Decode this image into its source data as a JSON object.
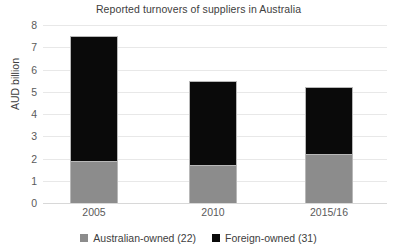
{
  "chart_data": {
    "type": "bar",
    "subtype": "stacked-vertical",
    "title": "Reported turnovers of suppliers in Australia",
    "xlabel": "",
    "ylabel": "AUD billion",
    "categories": [
      "2005",
      "2010",
      "2015/16"
    ],
    "series": [
      {
        "name": "Australian-owned (22)",
        "color": "#8c8c8c",
        "values": [
          1.9,
          1.7,
          2.2
        ]
      },
      {
        "name": "Foreign-owned (31)",
        "color": "#0a0a0a",
        "values": [
          5.6,
          3.8,
          3.0
        ]
      }
    ],
    "totals": [
      7.5,
      5.5,
      5.2
    ],
    "ylim": [
      0,
      8
    ],
    "ytick_labels": [
      "8",
      "7",
      "6",
      "5",
      "4",
      "3",
      "2",
      "1",
      "0"
    ],
    "ytick_values": [
      8,
      7,
      6,
      5,
      4,
      3,
      2,
      1,
      0
    ],
    "grid": true,
    "legend_position": "bottom"
  },
  "legend": {
    "items": [
      {
        "label": "Australian-owned (22)",
        "swatch_color": "#8c8c8c",
        "swatch_name": "gray-square-icon"
      },
      {
        "label": "Foreign-owned (31)",
        "swatch_color": "#0a0a0a",
        "swatch_name": "black-square-icon"
      }
    ]
  },
  "colors": {
    "australian_owned": "#8c8c8c",
    "foreign_owned": "#0a0a0a",
    "gridline": "#e8e8e8",
    "text": "#404040",
    "background": "#ffffff"
  }
}
